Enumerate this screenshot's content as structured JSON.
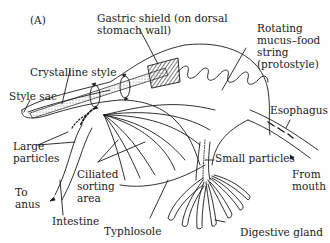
{
  "figure": {
    "panel_label": "(A)",
    "labels": {
      "gastric_shield": "Gastric shield (on dorsal\nstomach wall)",
      "rotating_string": "Rotating\nmucus–food\nstring\n(protostyle)",
      "crystalline_style": "Crystalline style",
      "style_sac": "Style sac",
      "esophagus": "Esophagus",
      "large_particles": "Large\nparticles",
      "ciliated_sorting": "Ciliated\nsorting\narea",
      "small_particles": "Small particles",
      "to_anus": "To\nanus",
      "from_mouth": "From\nmouth",
      "intestine": "Intestine",
      "typhlosole": "Typhlosole",
      "digestive_gland": "Digestive gland"
    },
    "colors": {
      "ink": "#1a1a1a",
      "background": "#ffffff"
    }
  }
}
